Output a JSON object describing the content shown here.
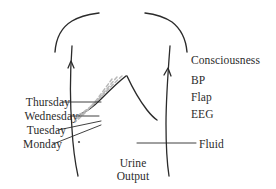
{
  "figure": {
    "background_color": "#ffffff",
    "ink_color": "#2b2b2b",
    "dashed_line_color": "#b9b9b9"
  },
  "day_labels": [
    {
      "id": "thursday",
      "text": "Thursday"
    },
    {
      "id": "wednesday",
      "text": "Wednesday"
    },
    {
      "id": "tuesday",
      "text": "Tuesday"
    },
    {
      "id": "monday",
      "text": "Monday"
    }
  ],
  "monitor_labels": [
    {
      "id": "consciousness",
      "text": "Consciousness"
    },
    {
      "id": "bp",
      "text": "BP"
    },
    {
      "id": "flap",
      "text": "Flap"
    },
    {
      "id": "eeg",
      "text": "EEG"
    }
  ],
  "annotations": {
    "fluid": "Fluid",
    "urine_output_line1": "Urine",
    "urine_output_line2": "Output"
  },
  "icons": {
    "torso": "torso-outline-icon",
    "left_arrow": "up-arrow-icon",
    "right_arrow": "up-arrow-icon",
    "liver_edge_solid": "liver-edge-solid-icon",
    "liver_edge_dashed": "liver-edge-dashed-icon",
    "marker_dot": "dot-marker-icon"
  }
}
